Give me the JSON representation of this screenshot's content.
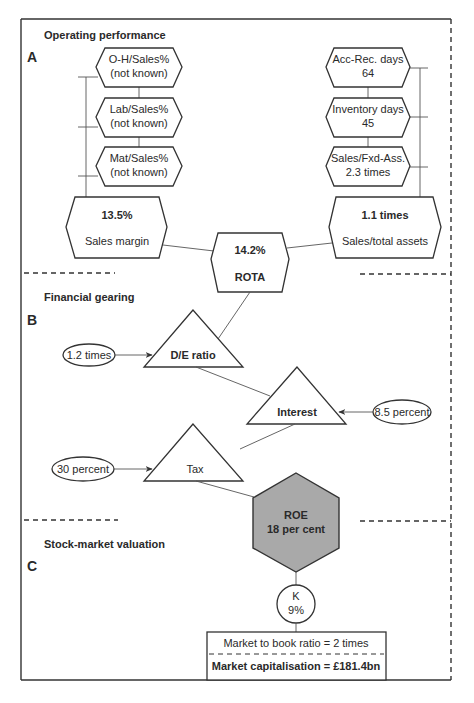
{
  "sections": {
    "a": {
      "letter": "A",
      "title": "Operating performance"
    },
    "b": {
      "letter": "B",
      "title": "Financial gearing"
    },
    "c": {
      "letter": "C",
      "title": "Stock-market valuation"
    }
  },
  "operating": {
    "left_drivers": [
      {
        "line1": "O-H/Sales%",
        "line2": "(not known)"
      },
      {
        "line1": "Lab/Sales%",
        "line2": "(not known)"
      },
      {
        "line1": "Mat/Sales%",
        "line2": "(not known)"
      }
    ],
    "right_drivers": [
      {
        "line1": "Acc-Rec. days",
        "line2": "64"
      },
      {
        "line1": "Inventory days",
        "line2": "45"
      },
      {
        "line1": "Sales/Fxd-Ass.",
        "line2": "2.3 times"
      }
    ],
    "sales_margin": {
      "value": "13.5%",
      "label": "Sales margin"
    },
    "asset_turnover": {
      "value": "1.1 times",
      "label": "Sales/total assets"
    },
    "rota": {
      "value": "14.2%",
      "label": "ROTA"
    }
  },
  "gearing": {
    "de_ratio": {
      "label": "D/E ratio",
      "input": "1.2 times"
    },
    "interest": {
      "label": "Interest",
      "input": "8.5 percent"
    },
    "tax": {
      "label": "Tax",
      "input": "30 percent"
    }
  },
  "roe": {
    "label": "ROE",
    "value": "18 per cent",
    "fill": "#a9a9a9"
  },
  "valuation": {
    "k": {
      "label": "K",
      "value": "9%"
    },
    "market_to_book": "Market to book ratio = 2 times",
    "market_cap": "Market capitalisation = £181.4bn"
  }
}
